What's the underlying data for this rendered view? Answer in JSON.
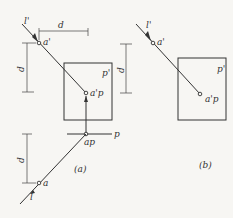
{
  "figure_a": {
    "caption": "(a)",
    "labels": {
      "line_top": "l'",
      "point_top": "a'",
      "plane_front": "p'",
      "point_proj_front": "a'p",
      "plane_top": "p",
      "point_proj_top": "ap",
      "point_bottom": "a",
      "line_bottom": "l",
      "dim_horizontal": "d",
      "dim_vertical_upper": "d",
      "dim_vertical_lower": "d"
    }
  },
  "figure_b": {
    "caption": "(b)",
    "labels": {
      "line_top": "l'",
      "point_top": "a'",
      "plane_front": "p'",
      "point_proj_front": "a'p",
      "dim_vertical": "d"
    }
  }
}
